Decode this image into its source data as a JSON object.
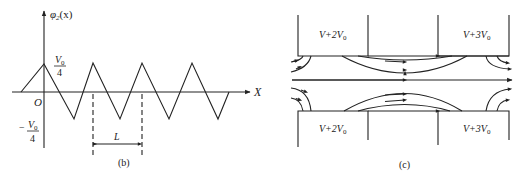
{
  "figure_b": {
    "y_axis_label": "φ",
    "y_axis_sub": "2",
    "y_axis_arg": "(x)",
    "x_axis_label": "X",
    "origin_label": "O",
    "pos_num": "V",
    "pos_num_sub": "0",
    "pos_den": "4",
    "neg_sign": "−",
    "neg_num": "V",
    "neg_num_sub": "0",
    "neg_den": "4",
    "period_label": "L",
    "caption": "(b)",
    "wave_points": [
      [
        20,
        92
      ],
      [
        44,
        63
      ],
      [
        120,
        119
      ],
      [
        93,
        63
      ],
      [
        120,
        119
      ],
      [
        142,
        63
      ],
      [
        169,
        119
      ],
      [
        192,
        63
      ],
      [
        218,
        119
      ],
      [
        229,
        92
      ]
    ]
  },
  "figure_c": {
    "top_left_label": "V+2V",
    "top_left_sub": "0",
    "top_right_label": "V+3V",
    "top_right_sub": "0",
    "bottom_left_label": "V+2V",
    "bottom_left_sub": "0",
    "bottom_right_label": "V+3V",
    "bottom_right_sub": "0",
    "caption": "(c)"
  }
}
